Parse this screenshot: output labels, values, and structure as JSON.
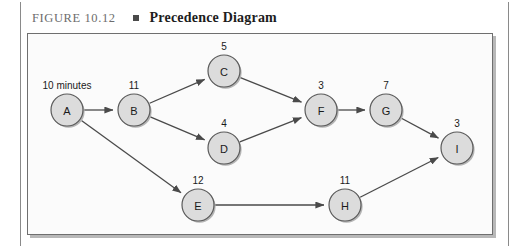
{
  "figure": {
    "number": "FIGURE 10.12",
    "bullet": "square-bullet",
    "title": "Precedence Diagram"
  },
  "diagram": {
    "type": "precedence-diagram",
    "nodes": [
      {
        "id": "A",
        "label": "A",
        "duration": "10 minutes",
        "cx": 40,
        "cy": 77,
        "r": 16
      },
      {
        "id": "B",
        "label": "B",
        "duration": "11",
        "cx": 107,
        "cy": 77,
        "r": 16
      },
      {
        "id": "C",
        "label": "C",
        "duration": "5",
        "cx": 197,
        "cy": 38,
        "r": 16
      },
      {
        "id": "D",
        "label": "D",
        "duration": "4",
        "cx": 197,
        "cy": 115,
        "r": 16
      },
      {
        "id": "E",
        "label": "E",
        "duration": "12",
        "cx": 171,
        "cy": 172,
        "r": 16
      },
      {
        "id": "F",
        "label": "F",
        "duration": "3",
        "cx": 294,
        "cy": 77,
        "r": 16
      },
      {
        "id": "G",
        "label": "G",
        "duration": "7",
        "cx": 359,
        "cy": 77,
        "r": 16
      },
      {
        "id": "H",
        "label": "H",
        "duration": "11",
        "cx": 318,
        "cy": 172,
        "r": 16
      },
      {
        "id": "I",
        "label": "I",
        "duration": "3",
        "cx": 430,
        "cy": 115,
        "r": 16
      }
    ],
    "edges": [
      {
        "from": "A",
        "to": "B"
      },
      {
        "from": "A",
        "to": "E"
      },
      {
        "from": "B",
        "to": "C"
      },
      {
        "from": "B",
        "to": "D"
      },
      {
        "from": "C",
        "to": "F"
      },
      {
        "from": "D",
        "to": "F"
      },
      {
        "from": "F",
        "to": "G"
      },
      {
        "from": "G",
        "to": "I"
      },
      {
        "from": "E",
        "to": "H"
      },
      {
        "from": "H",
        "to": "I"
      }
    ],
    "colors": {
      "node_fill": "#dcdcdc",
      "node_stroke": "#5a5a5a",
      "edge": "#4a4a4a",
      "panel_bg": "#fbfbfb",
      "panel_border": "#6f6f6f"
    }
  }
}
